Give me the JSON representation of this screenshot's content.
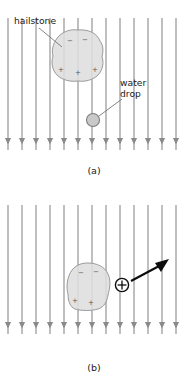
{
  "figure": {
    "background_color": "#ffffff",
    "panels": [
      {
        "id": "a",
        "caption": "(a)",
        "caption_x": 94,
        "caption_y": 174,
        "field": {
          "name": "downward-electric-field",
          "line_count": 13,
          "direction": "downward",
          "color": "#8a8a8a",
          "x_positions": [
            8,
            22,
            36,
            50,
            64,
            78,
            92,
            106,
            120,
            134,
            148,
            162,
            176
          ],
          "y_top": 18,
          "y_bottom": 150,
          "arrow_y": 143
        },
        "hailstone": {
          "label": "hailstone",
          "label_x": 14,
          "label_y": 24,
          "center_x": 78,
          "center_y": 56,
          "fill_color": "#dedede",
          "stroke_color": "#9a9a9a",
          "leader_from_x": 39,
          "leader_from_y": 28,
          "leader_to_x": 62,
          "leader_to_y": 47,
          "top_charges": [
            "−",
            "−"
          ],
          "bottom_charges": [
            "+",
            "+",
            "+"
          ]
        },
        "water_drop": {
          "label_line_1": "water",
          "label_line_2": "drop",
          "label_x": 120,
          "label_y": 86,
          "center_x": 93,
          "center_y": 120,
          "radius": 6.5,
          "fill_color": "#c9c9c9",
          "stroke_color": "#7d7d7d",
          "leader_from_x": 99,
          "leader_from_y": 116,
          "leader_to_x": 122,
          "leader_to_y": 99
        }
      },
      {
        "id": "b",
        "caption": "(b)",
        "caption_x": 94,
        "caption_y": 178,
        "field": {
          "name": "downward-electric-field",
          "line_count": 13,
          "direction": "downward",
          "color": "#8a8a8a",
          "x_positions": [
            8,
            22,
            36,
            50,
            64,
            78,
            92,
            106,
            120,
            134,
            148,
            162,
            176
          ],
          "y_top": 12,
          "y_bottom": 141,
          "arrow_y": 134
        },
        "hailstone": {
          "label": "",
          "center_x": 88,
          "center_y": 92,
          "fill_color": "#dedede",
          "stroke_color": "#9a9a9a",
          "top_charges": [
            "−",
            "−"
          ],
          "bottom_charges": [
            "+",
            "+"
          ]
        },
        "positive_charge": {
          "symbol": "+",
          "center_x": 122,
          "center_y": 92,
          "radius": 6.6,
          "stroke_color": "#0d0d0d"
        },
        "force_arrow": {
          "name": "electric-force-arrow",
          "from_x": 130,
          "from_y": 88,
          "to_x": 168,
          "to_y": 68,
          "color": "#0d0d0d"
        }
      }
    ]
  }
}
